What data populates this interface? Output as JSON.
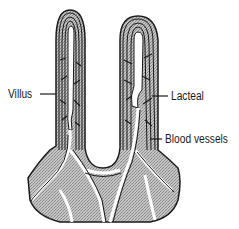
{
  "diagram": {
    "labels": [
      {
        "id": "villus",
        "text": "Villus"
      },
      {
        "id": "lacteal",
        "text": "Lacteal"
      },
      {
        "id": "blood_vessels",
        "text": "Blood vessels"
      }
    ],
    "colors": {
      "outline": "#1a1a1a",
      "tissue_fill": "#b8b8b8",
      "channel_fill": "#ffffff",
      "background": "#ffffff"
    }
  }
}
